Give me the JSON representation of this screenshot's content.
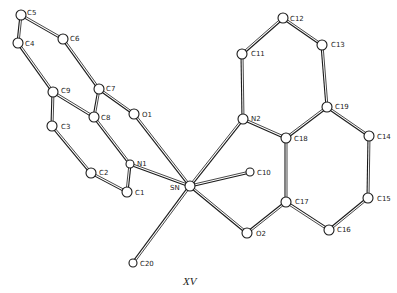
{
  "figure": {
    "caption": "XV",
    "atoms": [
      {
        "id": "C5",
        "x": 21,
        "y": 15,
        "r": 5,
        "lx": 27,
        "ly": 15
      },
      {
        "id": "C6",
        "x": 63,
        "y": 39,
        "r": 5,
        "lx": 70,
        "ly": 41
      },
      {
        "id": "C4",
        "x": 18,
        "y": 43,
        "r": 5,
        "lx": 25,
        "ly": 46
      },
      {
        "id": "C9",
        "x": 53,
        "y": 92,
        "r": 5,
        "lx": 61,
        "ly": 93
      },
      {
        "id": "C7",
        "x": 99,
        "y": 89,
        "r": 5,
        "lx": 106,
        "ly": 91
      },
      {
        "id": "C8",
        "x": 94,
        "y": 117,
        "r": 5,
        "lx": 101,
        "ly": 120
      },
      {
        "id": "O1",
        "x": 134,
        "y": 114,
        "r": 5,
        "lx": 142,
        "ly": 117
      },
      {
        "id": "C3",
        "x": 52,
        "y": 126,
        "r": 5,
        "lx": 61,
        "ly": 129
      },
      {
        "id": "C2",
        "x": 91,
        "y": 173,
        "r": 5,
        "lx": 99,
        "ly": 175
      },
      {
        "id": "C1",
        "x": 127,
        "y": 192,
        "r": 5,
        "lx": 135,
        "ly": 195
      },
      {
        "id": "N1",
        "x": 130,
        "y": 164,
        "r": 4,
        "lx": 137,
        "ly": 166
      },
      {
        "id": "SN",
        "x": 190,
        "y": 186,
        "r": 5,
        "lx": 170,
        "ly": 190
      },
      {
        "id": "C12",
        "x": 283,
        "y": 18,
        "r": 5,
        "lx": 290,
        "ly": 21
      },
      {
        "id": "C13",
        "x": 322,
        "y": 45,
        "r": 5,
        "lx": 331,
        "ly": 47
      },
      {
        "id": "C11",
        "x": 242,
        "y": 54,
        "r": 5,
        "lx": 251,
        "ly": 56
      },
      {
        "id": "N2",
        "x": 243,
        "y": 119,
        "r": 5,
        "lx": 251,
        "ly": 121
      },
      {
        "id": "C19",
        "x": 327,
        "y": 107,
        "r": 5,
        "lx": 335,
        "ly": 109
      },
      {
        "id": "C18",
        "x": 286,
        "y": 138,
        "r": 5,
        "lx": 294,
        "ly": 141
      },
      {
        "id": "C14",
        "x": 369,
        "y": 136,
        "r": 5,
        "lx": 377,
        "ly": 139
      },
      {
        "id": "C10",
        "x": 250,
        "y": 172,
        "r": 4,
        "lx": 257,
        "ly": 175
      },
      {
        "id": "C17",
        "x": 286,
        "y": 202,
        "r": 5,
        "lx": 295,
        "ly": 204
      },
      {
        "id": "C15",
        "x": 368,
        "y": 198,
        "r": 5,
        "lx": 377,
        "ly": 201
      },
      {
        "id": "C16",
        "x": 329,
        "y": 230,
        "r": 5,
        "lx": 337,
        "ly": 232
      },
      {
        "id": "O2",
        "x": 247,
        "y": 233,
        "r": 5,
        "lx": 256,
        "ly": 236
      },
      {
        "id": "C20",
        "x": 133,
        "y": 263,
        "r": 4,
        "lx": 140,
        "ly": 266
      }
    ],
    "bonds": [
      [
        "C5",
        "C4"
      ],
      [
        "C5",
        "C6"
      ],
      [
        "C4",
        "C9"
      ],
      [
        "C6",
        "C7"
      ],
      [
        "C7",
        "C8"
      ],
      [
        "C7",
        "O1"
      ],
      [
        "C9",
        "C8"
      ],
      [
        "C9",
        "C3"
      ],
      [
        "C3",
        "C2"
      ],
      [
        "C8",
        "N1"
      ],
      [
        "C2",
        "C1"
      ],
      [
        "C1",
        "N1"
      ],
      [
        "N1",
        "SN"
      ],
      [
        "O1",
        "SN"
      ],
      [
        "SN",
        "C20"
      ],
      [
        "SN",
        "C10"
      ],
      [
        "SN",
        "O2"
      ],
      [
        "SN",
        "N2"
      ],
      [
        "C11",
        "C12"
      ],
      [
        "C12",
        "C13"
      ],
      [
        "C11",
        "N2"
      ],
      [
        "C13",
        "C19"
      ],
      [
        "N2",
        "C18"
      ],
      [
        "C18",
        "C19"
      ],
      [
        "C19",
        "C14"
      ],
      [
        "C18",
        "C17"
      ],
      [
        "C14",
        "C15"
      ],
      [
        "C15",
        "C16"
      ],
      [
        "C16",
        "C17"
      ],
      [
        "C17",
        "O2"
      ]
    ]
  }
}
